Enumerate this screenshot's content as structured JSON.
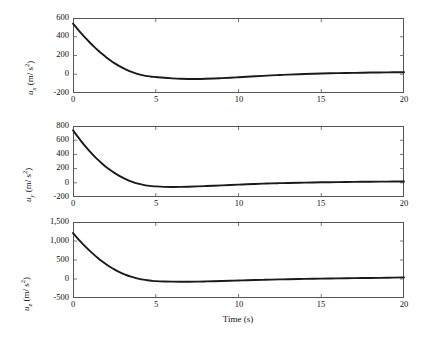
{
  "figure": {
    "background": "#ffffff",
    "line_color": "#1a1a1a",
    "axis_color": "#555555",
    "xlabel": "Time (s)"
  },
  "chart_data": [
    {
      "type": "line",
      "title": "",
      "xlabel": "",
      "ylabel": "u_x (m/ s^2)",
      "ylabel_base": "u",
      "ylabel_sub": "x",
      "ylabel_unit": " (m/ s",
      "ylabel_sup": "2",
      "ylabel_close": ")",
      "xlim": [
        0,
        20
      ],
      "ylim": [
        -200,
        600
      ],
      "xticks": [
        0,
        5,
        10,
        15,
        20
      ],
      "xticklabels": [
        "0",
        "5",
        "10",
        "15",
        "20"
      ],
      "yticks": [
        -200,
        0,
        200,
        400,
        600
      ],
      "yticklabels": [
        "-200",
        "0",
        "200",
        "400",
        "600"
      ],
      "grid": false,
      "legend": null,
      "series": [
        {
          "name": "u_x",
          "x": [
            0,
            0.25,
            0.5,
            0.75,
            1.0,
            1.25,
            1.5,
            1.75,
            2.0,
            2.25,
            2.5,
            2.75,
            3.0,
            3.25,
            3.5,
            3.75,
            4.0,
            4.25,
            4.5,
            4.75,
            5.0,
            5.5,
            6.0,
            6.5,
            7.0,
            7.5,
            8.0,
            8.5,
            9.0,
            9.5,
            10.0,
            10.5,
            11.0,
            11.5,
            12.0,
            12.5,
            13.0,
            14.0,
            15.0,
            16.0,
            17.0,
            18.0,
            19.0,
            20.0
          ],
          "y": [
            540,
            487,
            436,
            387,
            341,
            297,
            256,
            218,
            182,
            149,
            119,
            92,
            68,
            46,
            27,
            11,
            -2,
            -12,
            -20,
            -26,
            -30,
            -38,
            -44,
            -48,
            -50,
            -50,
            -48,
            -45,
            -41,
            -37,
            -32,
            -27,
            -22,
            -17,
            -12,
            -8,
            -4,
            2,
            8,
            12,
            15,
            18,
            20,
            22
          ]
        }
      ]
    },
    {
      "type": "line",
      "title": "",
      "xlabel": "",
      "ylabel": "u_y (m/ s^2)",
      "ylabel_base": "u",
      "ylabel_sub": "y",
      "ylabel_unit": " (m/ s",
      "ylabel_sup": "2",
      "ylabel_close": ")",
      "xlim": [
        0,
        20
      ],
      "ylim": [
        -200,
        800
      ],
      "xticks": [
        0,
        5,
        10,
        15,
        20
      ],
      "xticklabels": [
        "0",
        "5",
        "10",
        "15",
        "20"
      ],
      "yticks": [
        -200,
        0,
        200,
        400,
        600,
        800
      ],
      "yticklabels": [
        "-200",
        "0",
        "200",
        "400",
        "600",
        "800"
      ],
      "grid": false,
      "legend": null,
      "series": [
        {
          "name": "u_y",
          "x": [
            0,
            0.25,
            0.5,
            0.75,
            1.0,
            1.25,
            1.5,
            1.75,
            2.0,
            2.25,
            2.5,
            2.75,
            3.0,
            3.25,
            3.5,
            3.75,
            4.0,
            4.25,
            4.5,
            4.75,
            5.0,
            5.5,
            6.0,
            6.5,
            7.0,
            7.5,
            8.0,
            8.5,
            9.0,
            9.5,
            10.0,
            10.5,
            11.0,
            11.5,
            12.0,
            12.5,
            13.0,
            14.0,
            15.0,
            16.0,
            17.0,
            18.0,
            19.0,
            20.0
          ],
          "y": [
            740,
            660,
            584,
            513,
            446,
            384,
            326,
            273,
            224,
            180,
            140,
            104,
            72,
            44,
            20,
            0,
            -16,
            -29,
            -39,
            -46,
            -51,
            -57,
            -59,
            -58,
            -55,
            -51,
            -46,
            -41,
            -36,
            -31,
            -26,
            -21,
            -16,
            -12,
            -8,
            -5,
            -2,
            3,
            7,
            10,
            13,
            15,
            17,
            19
          ]
        }
      ]
    },
    {
      "type": "line",
      "title": "",
      "xlabel": "Time (s)",
      "ylabel": "u_z (m/ s^2)",
      "ylabel_base": "u",
      "ylabel_sub": "z",
      "ylabel_unit": " (m/ s",
      "ylabel_sup": "2",
      "ylabel_close": ")",
      "xlim": [
        0,
        20
      ],
      "ylim": [
        -500,
        1500
      ],
      "xticks": [
        0,
        5,
        10,
        15,
        20
      ],
      "xticklabels": [
        "0",
        "5",
        "10",
        "15",
        "20"
      ],
      "yticks": [
        -500,
        0,
        500,
        1000,
        1500
      ],
      "yticklabels": [
        "-500",
        "0",
        "500",
        "1,000",
        "1,500"
      ],
      "grid": false,
      "legend": null,
      "series": [
        {
          "name": "u_z",
          "x": [
            0,
            0.25,
            0.5,
            0.75,
            1.0,
            1.25,
            1.5,
            1.75,
            2.0,
            2.25,
            2.5,
            2.75,
            3.0,
            3.25,
            3.5,
            3.75,
            4.0,
            4.25,
            4.5,
            4.75,
            5.0,
            5.5,
            6.0,
            6.5,
            7.0,
            7.5,
            8.0,
            8.5,
            9.0,
            9.5,
            10.0,
            10.5,
            11.0,
            11.5,
            12.0,
            12.5,
            13.0,
            14.0,
            15.0,
            16.0,
            17.0,
            18.0,
            19.0,
            20.0
          ],
          "y": [
            1210,
            1085,
            966,
            853,
            747,
            647,
            554,
            468,
            389,
            317,
            252,
            194,
            143,
            99,
            61,
            29,
            3,
            -18,
            -34,
            -46,
            -55,
            -65,
            -70,
            -72,
            -71,
            -68,
            -64,
            -59,
            -53,
            -47,
            -41,
            -34,
            -28,
            -22,
            -16,
            -11,
            -6,
            3,
            10,
            16,
            22,
            28,
            34,
            42
          ]
        }
      ]
    }
  ]
}
